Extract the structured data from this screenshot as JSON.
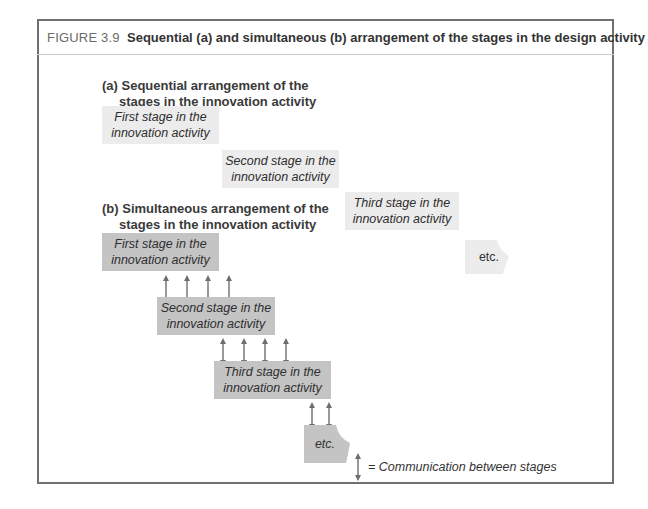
{
  "figure": {
    "label": "FIGURE 3.9",
    "title": "Sequential (a) and simultaneous (b) arrangement of the stages in the design activity"
  },
  "section_a": {
    "heading_line1": "(a) Sequential arrangement of the",
    "heading_line2": "stages in the innovation activity",
    "stages": [
      {
        "line1": "First stage in the",
        "line2": "innovation activity"
      },
      {
        "line1": "Second stage in the",
        "line2": "innovation activity"
      },
      {
        "line1": "Third stage in the",
        "line2": "innovation activity"
      }
    ],
    "etc": "etc."
  },
  "section_b": {
    "heading_line1": "(b) Simultaneous arrangement of the",
    "heading_line2": "stages in the innovation activity",
    "stages": [
      {
        "line1": "First stage in the",
        "line2": "innovation activity"
      },
      {
        "line1": "Second stage in the",
        "line2": "innovation activity"
      },
      {
        "line1": "Third stage in the",
        "line2": "innovation activity"
      }
    ],
    "etc": "etc.",
    "arrow_counts": [
      4,
      4,
      2
    ]
  },
  "legend": {
    "icon": "double-arrow-icon",
    "text": "= Communication between stages"
  },
  "colors": {
    "light_box": "#ececec",
    "dark_box": "#c4c4c4",
    "frame": "#707070",
    "arrow": "#6e6e6e"
  }
}
